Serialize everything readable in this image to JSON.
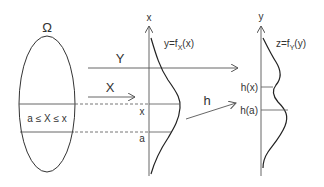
{
  "diagram": {
    "sample_space": {
      "label": "Ω",
      "event_label": "a ≤ X ≤ x"
    },
    "arrows": {
      "Y": "Y",
      "X": "X",
      "h": "h"
    },
    "left_plot": {
      "axis_label": "x",
      "curve_label": "y=f",
      "curve_label_sub": "X",
      "curve_label_tail": "(x)",
      "tick_x": "x",
      "tick_a": "a"
    },
    "right_plot": {
      "axis_label": "y",
      "curve_label": "z=f",
      "curve_label_sub": "Y",
      "curve_label_tail": "(y)",
      "tick_hx": "h(x)",
      "tick_ha": "h(a)"
    },
    "colors": {
      "stroke": "#333333",
      "gray_line": "#888888",
      "background": "#ffffff"
    }
  }
}
